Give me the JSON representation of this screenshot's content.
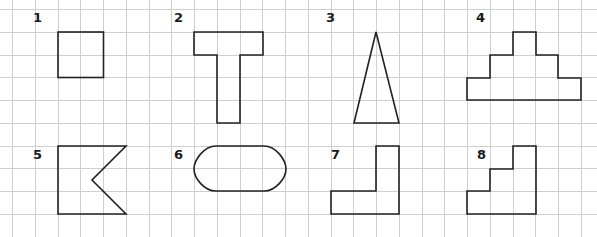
{
  "grid": {
    "origin_x": 12,
    "origin_y": 9,
    "cell": 22.75,
    "columns": 26,
    "rows": 10,
    "line_color": "#cfcfcf"
  },
  "stroke_color": "#222222",
  "shapes": [
    {
      "number": "1",
      "name": "square",
      "label_pos": [
        33,
        22
      ]
    },
    {
      "number": "2",
      "name": "t-shape",
      "label_pos": [
        174,
        22
      ]
    },
    {
      "number": "3",
      "name": "tall-triangle",
      "label_pos": [
        326,
        22
      ]
    },
    {
      "number": "4",
      "name": "stepped-pyramid",
      "label_pos": [
        476,
        22
      ]
    },
    {
      "number": "5",
      "name": "notched-pentagon-flag",
      "label_pos": [
        33,
        159
      ]
    },
    {
      "number": "6",
      "name": "rounded-capsule",
      "label_pos": [
        174,
        159
      ]
    },
    {
      "number": "7",
      "name": "l-shape",
      "label_pos": [
        331,
        159
      ]
    },
    {
      "number": "8",
      "name": "staircase",
      "label_pos": [
        477,
        159
      ]
    }
  ]
}
